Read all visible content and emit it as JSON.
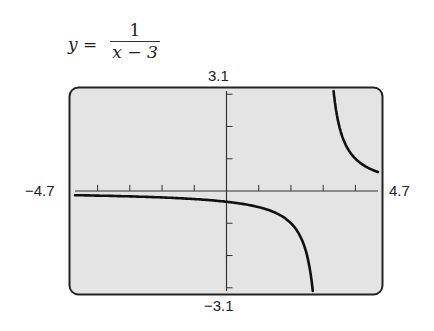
{
  "chart_data": {
    "type": "line",
    "equation": {
      "lhs": "y =",
      "numerator": "1",
      "denominator": "x − 3"
    },
    "window": {
      "xmin": -4.7,
      "xmax": 4.7,
      "ymin": -3.1,
      "ymax": 3.1,
      "xscale": 1,
      "yscale": 1
    },
    "tick_labels": {
      "xmin": "−4.7",
      "xmax": "4.7",
      "ymin": "−3.1",
      "ymax": "3.1"
    },
    "vertical_asymptote": 3,
    "horizontal_asymptote": 0,
    "series": [
      {
        "name": "left branch",
        "x": [
          -4.7,
          -4,
          -3,
          -2,
          -1,
          0,
          1,
          2,
          2.5,
          2.7
        ],
        "y": [
          -0.13,
          -0.14,
          -0.17,
          -0.2,
          -0.25,
          -0.33,
          -0.5,
          -1,
          -2,
          -3.1
        ]
      },
      {
        "name": "right branch",
        "x": [
          3.32,
          3.5,
          3.75,
          4,
          4.3,
          4.7
        ],
        "y": [
          3.1,
          2,
          1.33,
          1,
          0.77,
          0.59
        ]
      }
    ],
    "grid": false,
    "background": "#e6e6e6",
    "curve_color": "#111111"
  }
}
